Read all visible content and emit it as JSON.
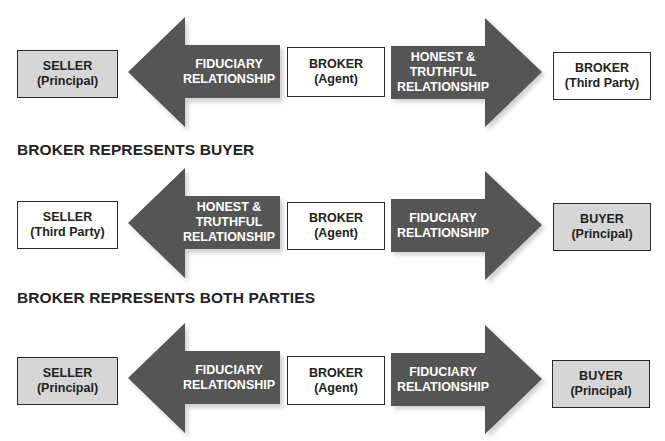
{
  "colors": {
    "arrow_fill": "#555555",
    "principal_fill": "#d6d6d6",
    "plain_fill": "#ffffff",
    "text": "#222222"
  },
  "rows": [
    {
      "title": "",
      "left_box": {
        "line1": "SELLER",
        "line2": "(Principal)",
        "style": "principal"
      },
      "left_arrow": {
        "lines": [
          "FIDUCIARY",
          "RELATIONSHIP"
        ],
        "direction": "left"
      },
      "center_box": {
        "line1": "BROKER",
        "line2": "(Agent)",
        "style": "plain"
      },
      "right_arrow": {
        "lines": [
          "HONEST &",
          "TRUTHFUL",
          "RELATIONSHIP"
        ],
        "direction": "right"
      },
      "right_box": {
        "line1": "BROKER",
        "line2": "(Third Party)",
        "style": "plain"
      }
    },
    {
      "title": "BROKER REPRESENTS BUYER",
      "left_box": {
        "line1": "SELLER",
        "line2": "(Third Party)",
        "style": "plain"
      },
      "left_arrow": {
        "lines": [
          "HONEST &",
          "TRUTHFUL",
          "RELATIONSHIP"
        ],
        "direction": "left"
      },
      "center_box": {
        "line1": "BROKER",
        "line2": "(Agent)",
        "style": "plain"
      },
      "right_arrow": {
        "lines": [
          "FIDUCIARY",
          "RELATIONSHIP"
        ],
        "direction": "right"
      },
      "right_box": {
        "line1": "BUYER",
        "line2": "(Principal)",
        "style": "principal"
      }
    },
    {
      "title": "BROKER REPRESENTS BOTH PARTIES",
      "left_box": {
        "line1": "SELLER",
        "line2": "(Principal)",
        "style": "principal"
      },
      "left_arrow": {
        "lines": [
          "FIDUCIARY",
          "RELATIONSHIP"
        ],
        "direction": "left"
      },
      "center_box": {
        "line1": "BROKER",
        "line2": "(Agent)",
        "style": "plain"
      },
      "right_arrow": {
        "lines": [
          "FIDUCIARY",
          "RELATIONSHIP"
        ],
        "direction": "right"
      },
      "right_box": {
        "line1": "BUYER",
        "line2": "(Principal)",
        "style": "principal"
      }
    }
  ]
}
